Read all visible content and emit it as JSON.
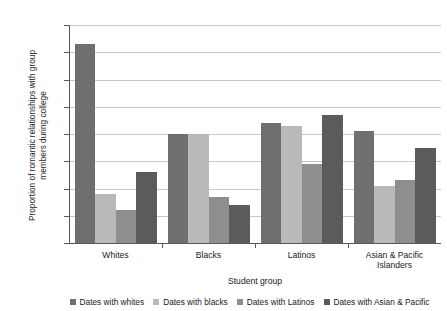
{
  "chart_data": {
    "type": "bar",
    "title": "",
    "xlabel": "Student group",
    "ylabel": "Proportion of romantic relationships with group\nmembers during college",
    "ylim": [
      0.0,
      0.8
    ],
    "ytick_labels": [
      "0.00",
      "0.10",
      "0.20",
      "0.30",
      "0.40",
      "0.50",
      "0.60",
      "0.70",
      "0.80"
    ],
    "ytick_values": [
      0.0,
      0.1,
      0.2,
      0.3,
      0.4,
      0.5,
      0.6,
      0.7,
      0.8
    ],
    "grid": true,
    "legend_position": "bottom",
    "categories": [
      "Whites",
      "Blacks",
      "Latinos",
      "Asian & Pacific\nIslanders"
    ],
    "series": [
      {
        "name": "Dates with whites",
        "color": "#6f6f71",
        "values": [
          0.73,
          0.4,
          0.44,
          0.41
        ]
      },
      {
        "name": "Dates with blacks",
        "color": "#b9b9ba",
        "values": [
          0.18,
          0.4,
          0.43,
          0.21
        ]
      },
      {
        "name": "Dates with Latinos",
        "color": "#8e8e90",
        "values": [
          0.12,
          0.17,
          0.29,
          0.23
        ]
      },
      {
        "name": "Dates with Asian & Pacific",
        "color": "#5b5b5d",
        "values": [
          0.26,
          0.14,
          0.47,
          0.35
        ]
      }
    ]
  }
}
